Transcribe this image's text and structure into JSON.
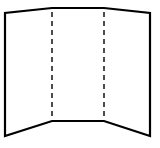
{
  "diagram": {
    "canvas": {
      "width": 160,
      "height": 148,
      "background": "#ffffff"
    },
    "stroke_color": "#000000",
    "outline_stroke_width": 2.2,
    "fold_stroke_width": 1.4,
    "fold_dash": "5 4",
    "panels": [
      {
        "name": "left-panel",
        "points": [
          [
            5,
            13
          ],
          [
            52,
            8
          ],
          [
            52,
            121
          ],
          [
            5,
            136
          ]
        ]
      },
      {
        "name": "center-panel",
        "points": [
          [
            52,
            8
          ],
          [
            104,
            8
          ],
          [
            104,
            121
          ],
          [
            52,
            121
          ]
        ]
      },
      {
        "name": "right-panel",
        "points": [
          [
            104,
            8
          ],
          [
            150,
            13
          ],
          [
            150,
            136
          ],
          [
            104,
            121
          ]
        ]
      }
    ],
    "fold_lines": [
      {
        "name": "left-fold-line",
        "x1": 52,
        "y1": 8,
        "x2": 52,
        "y2": 121
      },
      {
        "name": "right-fold-line",
        "x1": 104,
        "y1": 8,
        "x2": 104,
        "y2": 121
      }
    ]
  }
}
